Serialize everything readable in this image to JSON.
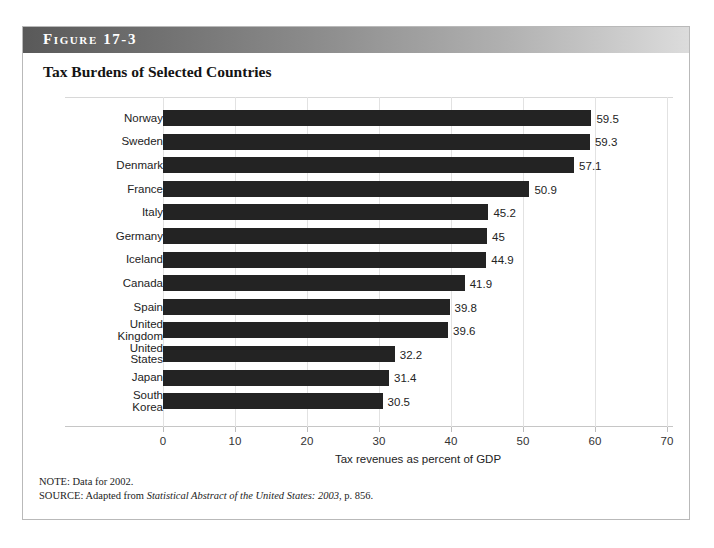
{
  "figure": {
    "label": "Figure 17-3",
    "title": "Tax Burdens of Selected Countries"
  },
  "notes": {
    "note_prefix": "NOTE: Data for 2002.",
    "source_prefix": "SOURCE: Adapted from ",
    "source_italic": "Statistical Abstract of the United States: 2003",
    "source_suffix": ", p. 856."
  },
  "colors": {
    "bar": "#232323",
    "grid": "#e2e2e2",
    "banner_dark": "#595959",
    "banner_light": "#dcdcdc"
  },
  "chart_data": {
    "type": "bar",
    "orientation": "horizontal",
    "title": "Tax Burdens of Selected Countries",
    "xlabel": "Tax revenues as percent of GDP",
    "ylabel": "",
    "xlim": [
      0,
      70
    ],
    "xticks": [
      0,
      10,
      20,
      30,
      40,
      50,
      60,
      70
    ],
    "xtick_labels": [
      "0",
      "10",
      "20",
      "30",
      "40",
      "50",
      "60",
      "70"
    ],
    "grid": "vertical",
    "legend": "none",
    "categories": [
      "Norway",
      "Sweden",
      "Denmark",
      "France",
      "Italy",
      "Germany",
      "Iceland",
      "Canada",
      "Spain",
      "United\nKingdom",
      "United\nStates",
      "Japan",
      "South\nKorea"
    ],
    "values": [
      59.5,
      59.3,
      57.1,
      50.9,
      45.2,
      45,
      44.9,
      41.9,
      39.8,
      39.6,
      32.2,
      31.4,
      30.5
    ],
    "value_labels": [
      "59.5",
      "59.3",
      "57.1",
      "50.9",
      "45.2",
      "45",
      "44.9",
      "41.9",
      "39.8",
      "39.6",
      "32.2",
      "31.4",
      "30.5"
    ]
  }
}
